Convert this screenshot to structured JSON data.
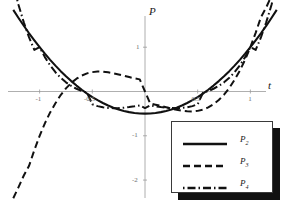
{
  "chart_data": {
    "type": "line",
    "title": "",
    "xlabel": "t",
    "ylabel": "P",
    "xlim": [
      -1.3,
      1.3
    ],
    "ylim": [
      -2.45,
      1.75
    ],
    "grid": false,
    "legend_position": "lower-right",
    "xticks": [
      {
        "value": -1,
        "label": "-1"
      },
      {
        "value": -0.5,
        "label": "-0.5"
      },
      {
        "value": 0.5,
        "label": "0.5"
      },
      {
        "value": 1,
        "label": "1"
      }
    ],
    "yticks": [
      {
        "value": 1,
        "label": "1"
      },
      {
        "value": -1,
        "label": "-1"
      },
      {
        "value": -2,
        "label": "-2"
      }
    ],
    "x": [
      -1.25,
      -1.2,
      -1.15,
      -1.1,
      -1.05,
      -1.0,
      -0.95,
      -0.9,
      -0.85,
      -0.8,
      -0.75,
      -0.7,
      -0.65,
      -0.6,
      -0.55,
      -0.5,
      -0.45,
      -0.4,
      -0.35,
      -0.3,
      -0.25,
      -0.2,
      -0.15,
      -0.1,
      -0.05,
      0.0,
      0.05,
      0.1,
      0.15,
      0.2,
      0.25,
      0.3,
      0.35,
      0.4,
      0.45,
      0.5,
      0.55,
      0.6,
      0.65,
      0.7,
      0.75,
      0.8,
      0.85,
      0.9,
      0.95,
      1.0,
      1.05,
      1.1,
      1.15,
      1.2,
      1.25
    ],
    "series": [
      {
        "name": "P2",
        "label": "P",
        "sub": "2",
        "style": "solid",
        "color": "#111111",
        "formula": "(3t^2 - 1)/2",
        "values": [
          1.844,
          1.66,
          1.484,
          1.315,
          1.154,
          1.0,
          0.854,
          0.715,
          0.584,
          0.46,
          0.344,
          0.235,
          0.134,
          0.04,
          -0.046,
          -0.125,
          -0.196,
          -0.26,
          -0.316,
          -0.365,
          -0.406,
          -0.44,
          -0.466,
          -0.485,
          -0.496,
          -0.5,
          -0.496,
          -0.485,
          -0.466,
          -0.44,
          -0.406,
          -0.365,
          -0.316,
          -0.26,
          -0.196,
          -0.125,
          -0.046,
          0.04,
          0.134,
          0.235,
          0.344,
          0.46,
          0.584,
          0.715,
          0.854,
          1.0,
          1.154,
          1.315,
          1.484,
          1.66,
          1.844
        ]
      },
      {
        "name": "P3",
        "label": "P",
        "sub": "3",
        "style": "dashed",
        "color": "#111111",
        "formula": "(5t^3 - 3t)/2",
        "values": [
          -2.41,
          -2.16,
          -1.897,
          -1.677,
          -1.324,
          -1.0,
          -0.719,
          -0.472,
          -0.2665,
          -0.08,
          0.07,
          0.193,
          0.289,
          0.36,
          0.409,
          0.4375,
          0.4495,
          0.448,
          0.434,
          0.4125,
          0.3855,
          0.356,
          0.3255,
          0.2975,
          0.274,
          0.0,
          -0.274,
          -0.2975,
          -0.3255,
          -0.356,
          -0.3855,
          -0.4125,
          -0.434,
          -0.448,
          -0.4495,
          -0.4375,
          -0.409,
          -0.36,
          -0.289,
          -0.193,
          -0.07,
          0.08,
          0.2665,
          0.472,
          0.719,
          1.0,
          1.324,
          1.677,
          1.897,
          2.16,
          2.41
        ]
      },
      {
        "name": "P4",
        "label": "P",
        "sub": "4",
        "style": "dashdot",
        "color": "#111111",
        "formula": "(35t^4 - 30t^2 + 3)/8",
        "values": [
          2.41,
          1.953,
          1.561,
          1.22,
          0.939,
          1.0,
          0.776,
          0.589,
          0.436,
          0.31,
          0.207,
          0.126,
          0.062,
          0.01,
          -0.028,
          -0.289,
          -0.33,
          -0.356,
          -0.37,
          -0.377,
          -0.375,
          -0.366,
          -0.352,
          -0.334,
          -0.313,
          -0.375,
          -0.313,
          -0.334,
          -0.352,
          -0.366,
          -0.375,
          -0.377,
          -0.37,
          -0.356,
          -0.33,
          -0.289,
          -0.028,
          0.01,
          0.062,
          0.126,
          0.207,
          0.31,
          0.436,
          0.589,
          0.776,
          1.0,
          0.939,
          1.22,
          1.561,
          1.953,
          2.41
        ]
      }
    ]
  },
  "axes": {
    "vertical_label": "P",
    "horizontal_label": "t"
  },
  "legend": {
    "entries": [
      {
        "label": "P",
        "sub": "2",
        "style": "solid"
      },
      {
        "label": "P",
        "sub": "3",
        "style": "dashed"
      },
      {
        "label": "P",
        "sub": "4",
        "style": "dashdot"
      }
    ]
  }
}
